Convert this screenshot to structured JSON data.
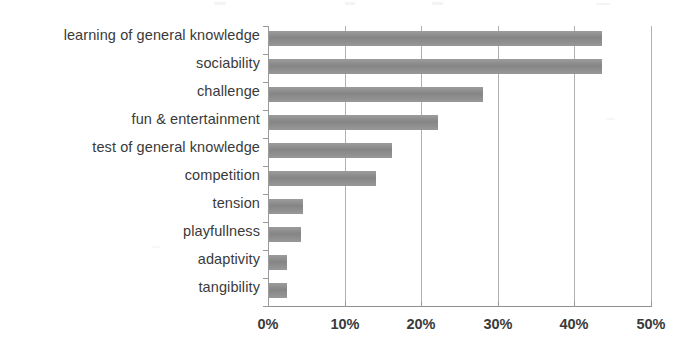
{
  "chart_data": {
    "type": "bar",
    "orientation": "horizontal",
    "title": "",
    "subtitle": "",
    "xlabel": "",
    "ylabel": "",
    "categories": [
      "learning of general knowledge",
      "sociability",
      "challenge",
      "fun & entertainment",
      "test of general knowledge",
      "competition",
      "tension",
      "playfullness",
      "adaptivity",
      "tangibility"
    ],
    "values": [
      43.5,
      43.5,
      28.0,
      22.0,
      16.0,
      14.0,
      4.4,
      4.2,
      2.4,
      2.3
    ],
    "value_unit": "%",
    "xlim": [
      0,
      50
    ],
    "tick_labels": [
      "0%",
      "10%",
      "20%",
      "30%",
      "40%",
      "50%"
    ],
    "tick_values": [
      0,
      10,
      20,
      30,
      40,
      50
    ],
    "grid": true,
    "grid_axis": "x",
    "legend": "none",
    "series": [
      {
        "name": "share of mentions",
        "values": [
          43.5,
          43.5,
          28.0,
          22.0,
          16.0,
          14.0,
          4.4,
          4.2,
          2.4,
          2.3
        ]
      }
    ]
  },
  "colors": {
    "bar": "#8c8c8c",
    "gridline": "#b0b0b0",
    "axis": "#9a9a9a",
    "text": "#3a3a3a",
    "background": "#ffffff"
  }
}
